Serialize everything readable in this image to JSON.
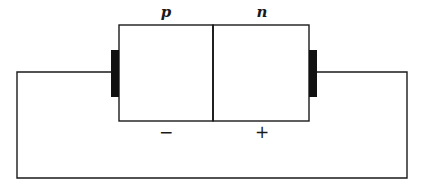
{
  "diagram": {
    "regions": [
      {
        "label": "p",
        "charge_sign": "−"
      },
      {
        "label": "n",
        "charge_sign": "+"
      }
    ],
    "electrodes": [
      "left-contact",
      "right-contact"
    ],
    "colors": {
      "line": "#1a1a1a",
      "electrode": "#111111",
      "background": "#ffffff"
    }
  }
}
